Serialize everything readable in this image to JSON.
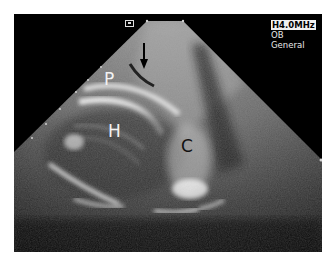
{
  "image": {
    "type": "obstetric ultrasound (sector scan)",
    "background_color": "#000000",
    "border_color": "#ffffff"
  },
  "overlay": {
    "frequency": "H4.0MHz",
    "preset": "OB",
    "mode": "General"
  },
  "labels": {
    "P": "P",
    "H": "H",
    "C": "C"
  },
  "annotations": {
    "arrow": "down-arrow-pointer",
    "orientation_marker": "probe-orientation-marker"
  }
}
